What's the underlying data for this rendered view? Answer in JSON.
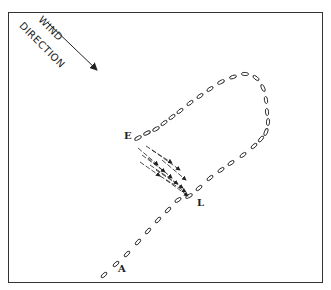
{
  "figure": {
    "wind_label_line1": "WIND",
    "wind_label_line2": "DIRECTION",
    "labels": {
      "start": "A",
      "turn_point": "L",
      "end": "E"
    },
    "colors": {
      "ink": "#222222",
      "background": "#ffffff"
    },
    "trail": [
      [
        104,
        275
      ],
      [
        116,
        264
      ],
      [
        127,
        254
      ],
      [
        138,
        242
      ],
      [
        148,
        231
      ],
      [
        158,
        220
      ],
      [
        168,
        210
      ],
      [
        178,
        200
      ],
      [
        189,
        196
      ],
      [
        199,
        188
      ],
      [
        210,
        178
      ],
      [
        221,
        170
      ],
      [
        231,
        163
      ],
      [
        243,
        155
      ],
      [
        254,
        146
      ],
      [
        261,
        139
      ],
      [
        266,
        132
      ],
      [
        268,
        122
      ],
      [
        267,
        112
      ],
      [
        266,
        100
      ],
      [
        263,
        88
      ],
      [
        256,
        78
      ],
      [
        245,
        74
      ],
      [
        233,
        77
      ],
      [
        221,
        82
      ],
      [
        210,
        89
      ],
      [
        200,
        96
      ],
      [
        190,
        103
      ],
      [
        180,
        111
      ],
      [
        172,
        117
      ],
      [
        164,
        123
      ],
      [
        156,
        129
      ],
      [
        147,
        133
      ],
      [
        138,
        138
      ]
    ],
    "wind_arrows": [
      [
        [
          138,
          148
        ],
        [
          158,
          165
        ]
      ],
      [
        [
          142,
          155
        ],
        [
          165,
          172
        ]
      ],
      [
        [
          148,
          158
        ],
        [
          172,
          178
        ]
      ],
      [
        [
          150,
          165
        ],
        [
          178,
          184
        ]
      ],
      [
        [
          156,
          170
        ],
        [
          183,
          188
        ]
      ],
      [
        [
          160,
          176
        ],
        [
          186,
          192
        ]
      ],
      [
        [
          166,
          180
        ],
        [
          188,
          196
        ]
      ],
      [
        [
          146,
          146
        ],
        [
          172,
          163
        ]
      ],
      [
        [
          152,
          150
        ],
        [
          180,
          170
        ]
      ],
      [
        [
          162,
          160
        ],
        [
          186,
          180
        ]
      ],
      [
        [
          140,
          162
        ],
        [
          160,
          176
        ]
      ]
    ]
  }
}
